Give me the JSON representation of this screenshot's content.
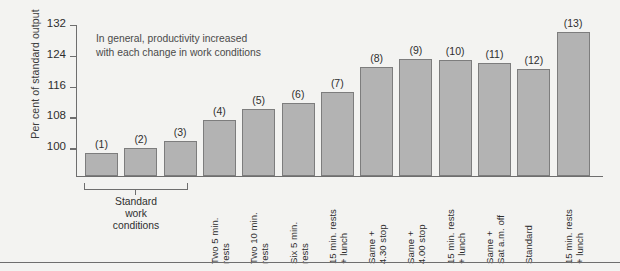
{
  "chart_data": {
    "type": "bar",
    "title": "",
    "subtitle": "",
    "annotation": "In general, productivity increased\nwith each change in work conditions",
    "xlabel": "",
    "ylabel": "Per cent of standard output",
    "ylim": [
      92.8,
      132
    ],
    "yticks": [
      100,
      108,
      116,
      124,
      132
    ],
    "ytick_labels": [
      "100",
      "108",
      "116",
      "124",
      "132"
    ],
    "grid": false,
    "legend": "none",
    "bar_color": "#b3b3b3",
    "bar_edge_color": "#7d7d7d",
    "axis_color": "#6e6e6e",
    "background_color": "#f3f3f1",
    "categories": [
      "Standard work conditions",
      "Standard work conditions",
      "Standard work conditions",
      "Two 5 min.\nrests",
      "Two 10 min.\nrests",
      "Six 5 min.\nrests",
      "15 min. rests\n+ lunch",
      "Same +\n4.30 stop",
      "Same +\n4.00 stop",
      "15 min. rests\n+ lunch",
      "Same +\nSat a.m. off",
      "Standard",
      "15 min. rests\n+ lunch"
    ],
    "point_labels": [
      "(1)",
      "(2)",
      "(3)",
      "(4)",
      "(5)",
      "(6)",
      "(7)",
      "(8)",
      "(9)",
      "(10)",
      "(11)",
      "(12)",
      "(13)"
    ],
    "values": [
      98.7,
      100.0,
      102.0,
      107.3,
      110.3,
      111.8,
      114.5,
      121.2,
      123.2,
      123.0,
      122.2,
      120.5,
      130.3
    ],
    "group_bracket": {
      "label": "Standard\nwork\nconditions",
      "spans_bars": [
        1,
        2,
        3
      ]
    }
  },
  "bars": [
    {
      "label": "(1)",
      "value": 98.7,
      "x_label": ""
    },
    {
      "label": "(2)",
      "value": 100.0,
      "x_label": ""
    },
    {
      "label": "(3)",
      "value": 102.0,
      "x_label": ""
    },
    {
      "label": "(4)",
      "value": 107.3,
      "x_label": "Two 5 min.\nrests"
    },
    {
      "label": "(5)",
      "value": 110.3,
      "x_label": "Two 10 min.\nrests"
    },
    {
      "label": "(6)",
      "value": 111.8,
      "x_label": "Six 5 min.\nrests"
    },
    {
      "label": "(7)",
      "value": 114.5,
      "x_label": "15 min. rests\n+ lunch"
    },
    {
      "label": "(8)",
      "value": 121.2,
      "x_label": "Same +\n4.30 stop"
    },
    {
      "label": "(9)",
      "value": 123.2,
      "x_label": "Same +\n4.00 stop"
    },
    {
      "label": "(10)",
      "value": 123.0,
      "x_label": "15 min. rests\n+ lunch"
    },
    {
      "label": "(11)",
      "value": 122.2,
      "x_label": "Same +\nSat a.m. off"
    },
    {
      "label": "(12)",
      "value": 120.5,
      "x_label": "Standard"
    },
    {
      "label": "(13)",
      "value": 130.3,
      "x_label": "15 min. rests\n+ lunch"
    }
  ]
}
